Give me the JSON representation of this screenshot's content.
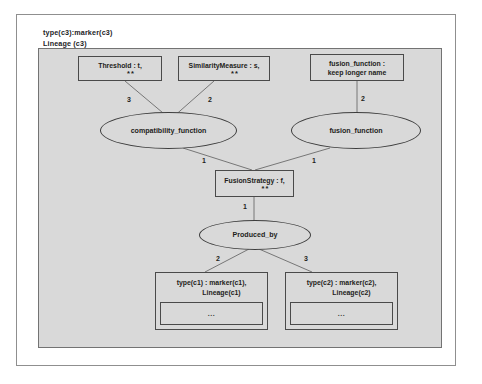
{
  "diagram": {
    "header": {
      "line1": "type(c3):marker(c3)",
      "line2": "Lineage (c3)"
    },
    "nodes": {
      "threshold": {
        "label": "Threshold : t,",
        "sublabel": "**"
      },
      "similarity_measure": {
        "label": "SimilarityMeasure : s,",
        "sublabel": "**"
      },
      "fusion_function_attr": {
        "line1": "fusion_function :",
        "line2": "keep longer name"
      },
      "compatibility_function": {
        "label": "compatibility_function"
      },
      "fusion_function": {
        "label": "fusion_function"
      },
      "fusion_strategy": {
        "label": "FusionStrategy : f,",
        "sublabel": "**"
      },
      "produced_by": {
        "label": "Produced_by"
      },
      "entity_c1": {
        "line1": "type(c1) : marker(c1),",
        "line2": "Lineage(c1)",
        "compartment": "..."
      },
      "entity_c2": {
        "line1": "type(c2) : marker(c2),",
        "line2": "Lineage(c2)",
        "compartment": "..."
      }
    },
    "edge_labels": {
      "threshold_to_compat": "3",
      "similarity_to_compat": "2",
      "fusionattr_to_fusionfn": "2",
      "compat_to_strategy": "1",
      "fusionfn_to_strategy": "1",
      "strategy_to_produced": "1",
      "produced_to_c1": "2",
      "produced_to_c2": "3"
    },
    "colors": {
      "panel_background": "#d9d9d9",
      "page_background": "#ffffff",
      "node_border": "#4a4a4a",
      "edge_stroke": "#6b6b6b",
      "text": "#1d1d1a"
    }
  }
}
